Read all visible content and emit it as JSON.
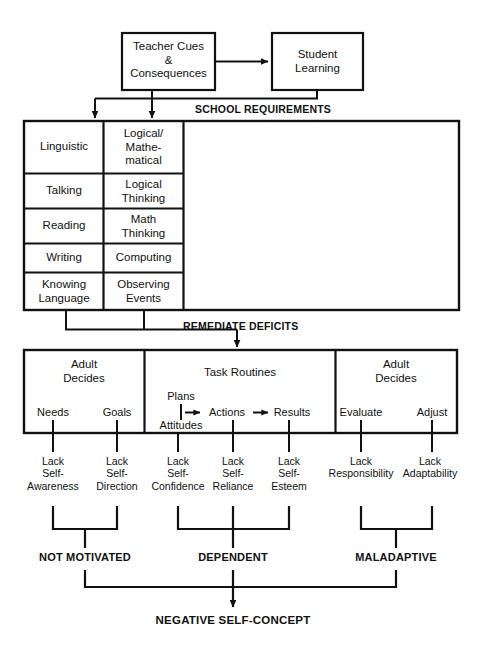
{
  "diagram": {
    "title_flow": "Negative Self-Concept development flowchart",
    "top_boxes": [
      {
        "id": "teacher-cues",
        "label": "Teacher Cues\n&\nConsequences"
      },
      {
        "id": "student-learning",
        "label": "Student\nLearning"
      }
    ],
    "bus_labels": {
      "school_requirements": "SCHOOL REQUIREMENTS",
      "remediate_deficits": "REMEDIATE DEFICITS"
    },
    "requirements_table": {
      "columns": [
        "Linguistic",
        "Logical/Mathematical"
      ],
      "rows": [
        {
          "left": "Linguistic",
          "right": "Logical/\nMathe-\nmatical"
        },
        {
          "left": "Talking",
          "right": "Logical\nThinking"
        },
        {
          "left": "Reading",
          "right": "Math\nThinking"
        },
        {
          "left": "Writing",
          "right": "Computing"
        },
        {
          "left": "Knowing\nLanguage",
          "right": "Observing\nEvents"
        }
      ]
    },
    "routines_band": {
      "panels": [
        {
          "id": "adult-decides-left",
          "title": "Adult\nDecides",
          "items": [
            "Needs",
            "Goals"
          ]
        },
        {
          "id": "task-routines",
          "title": "Task Routines",
          "items": [
            "Plans",
            "Attitudes",
            "Actions",
            "Results"
          ]
        },
        {
          "id": "adult-decides-right",
          "title": "Adult\nDecides",
          "items": [
            "Evaluate",
            "Adjust"
          ]
        }
      ]
    },
    "deficits": [
      "Lack\nSelf-\nAwareness",
      "Lack\nSelf-\nDirection",
      "Lack\nSelf-\nConfidence",
      "Lack\nSelf-\nReliance",
      "Lack\nSelf-\nEsteem",
      "Lack\nResponsibility",
      "Lack\nAdaptability"
    ],
    "outcomes": [
      "NOT MOTIVATED",
      "DEPENDENT",
      "MALADAPTIVE"
    ],
    "final_outcome": "NEGATIVE SELF-CONCEPT",
    "colors": {
      "line": "#111111",
      "text": "#111111",
      "background": "#ffffff"
    }
  }
}
